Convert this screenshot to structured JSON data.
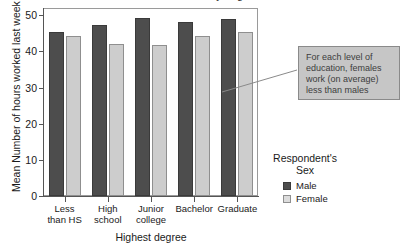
{
  "figure": {
    "clipped_title": "Mean hours worked by degree and sex"
  },
  "annotation": {
    "text": "For each level of education, females work (on average) less than males"
  },
  "legend": {
    "title": "Respondent's\nSex",
    "items": [
      {
        "label": "Male",
        "color": "#4d4d4d"
      },
      {
        "label": "Female",
        "color": "#dcdcdc"
      }
    ]
  },
  "axes": {
    "y_title": "Mean Number of hours worked last week",
    "x_title": "Highest degree",
    "y_ticks": [
      "0",
      "10",
      "20",
      "30",
      "40",
      "50"
    ]
  },
  "chart_data": {
    "type": "bar",
    "title": "Mean hours worked by degree and sex",
    "xlabel": "Highest degree",
    "ylabel": "Mean Number of hours worked last week",
    "ylim": [
      0,
      52
    ],
    "yticks": [
      0,
      10,
      20,
      30,
      40,
      50
    ],
    "grid": false,
    "legend_position": "right",
    "legend_title": "Respondent's Sex",
    "categories": [
      "Less than HS",
      "High school",
      "Junior college",
      "Bachelor",
      "Graduate"
    ],
    "series": [
      {
        "name": "Male",
        "color": "#4d4d4d",
        "values": [
          45.5,
          47.4,
          49.3,
          48.1,
          49.0
        ]
      },
      {
        "name": "Female",
        "color": "#cdcdcd",
        "values": [
          44.3,
          42.1,
          41.8,
          44.2,
          45.4
        ]
      }
    ],
    "annotations": [
      {
        "text": "For each level of education, females work (on average) less than males"
      }
    ]
  }
}
